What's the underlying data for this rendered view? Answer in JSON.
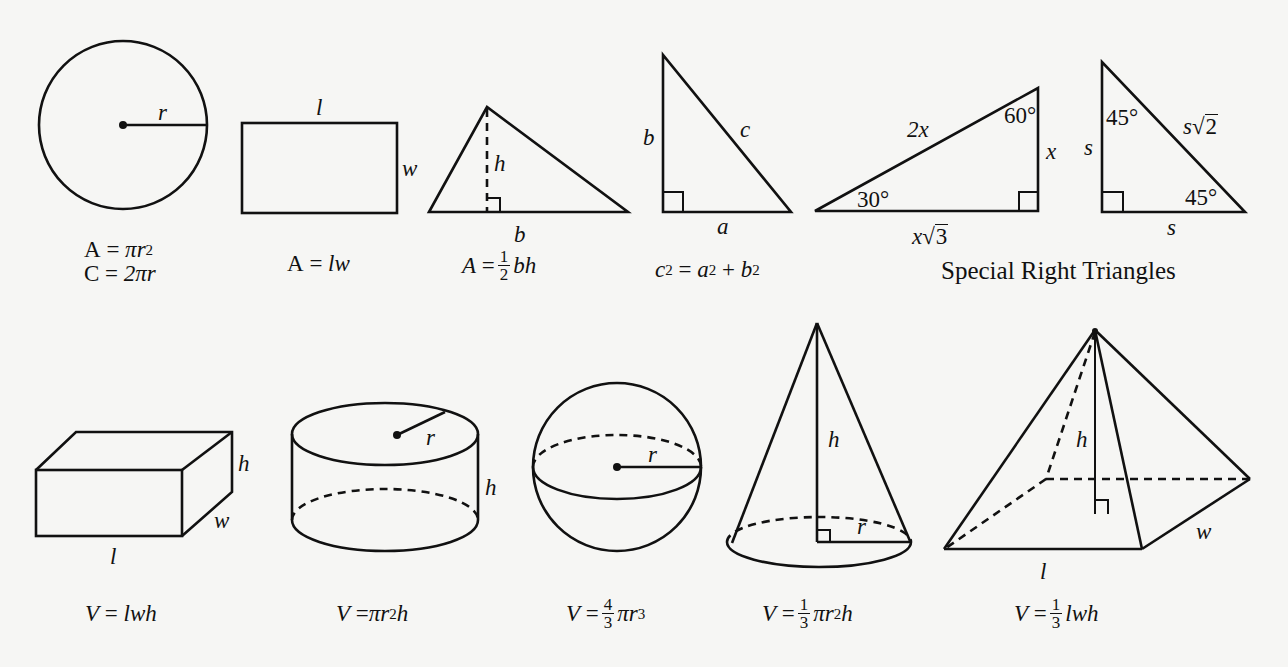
{
  "colors": {
    "background": "#f6f6f4",
    "ink": "#111111"
  },
  "figures": {
    "circle": {
      "labels": {
        "radius": "r"
      },
      "formulas": [
        {
          "lhs": "A",
          "eq": "=",
          "rhs": "πr",
          "exp": "2"
        },
        {
          "lhs": "C",
          "eq": "=",
          "rhs": "2πr"
        }
      ]
    },
    "rectangle": {
      "labels": {
        "length": "l",
        "width": "w"
      },
      "formula": {
        "lhs": "A",
        "eq": "=",
        "rhs": "lw"
      }
    },
    "triangle": {
      "labels": {
        "height": "h",
        "base": "b"
      },
      "formula": {
        "lhs": "A",
        "eq": "=",
        "frac_num": "1",
        "frac_den": "2",
        "rhs": "bh"
      }
    },
    "right_triangle": {
      "labels": {
        "leg_vertical": "b",
        "hypotenuse": "c",
        "leg_horizontal": "a"
      },
      "formula": {
        "c": "c",
        "c_exp": "2",
        "eq": "=",
        "a": "a",
        "a_exp": "2",
        "plus": "+",
        "b": "b",
        "b_exp": "2"
      }
    },
    "special_30_60_90": {
      "labels": {
        "hypotenuse": "2x",
        "short_leg": "x",
        "long_leg_coef": "x",
        "long_leg_radicand": "3",
        "angle_top": "60°",
        "angle_bottom": "30°"
      }
    },
    "special_45_45_90": {
      "labels": {
        "leg_vertical": "s",
        "leg_horizontal": "s",
        "hypotenuse_coef": "s",
        "hypotenuse_radicand": "2",
        "angle_top": "45°",
        "angle_bottom": "45°"
      }
    },
    "special_caption": "Special Right Triangles",
    "rect_prism": {
      "labels": {
        "height": "h",
        "width": "w",
        "length": "l"
      },
      "formula": {
        "lhs": "V",
        "eq": "=",
        "rhs": "lwh"
      }
    },
    "cylinder": {
      "labels": {
        "radius": "r",
        "height": "h"
      },
      "formula": {
        "lhs": "V",
        "eq": "=",
        "pi": "π",
        "r": "r",
        "exp": "2",
        "h": "h"
      }
    },
    "sphere": {
      "labels": {
        "radius": "r"
      },
      "formula": {
        "lhs": "V",
        "eq": "=",
        "frac_num": "4",
        "frac_den": "3",
        "pi": "π",
        "r": "r",
        "exp": "3"
      }
    },
    "cone": {
      "labels": {
        "height": "h",
        "radius": "r"
      },
      "formula": {
        "lhs": "V",
        "eq": "=",
        "frac_num": "1",
        "frac_den": "3",
        "pi": "π",
        "r": "r",
        "exp": "2",
        "h": "h"
      }
    },
    "pyramid": {
      "labels": {
        "height": "h",
        "width": "w",
        "length": "l"
      },
      "formula": {
        "lhs": "V",
        "eq": "=",
        "frac_num": "1",
        "frac_den": "3",
        "rhs": "lwh"
      }
    }
  }
}
